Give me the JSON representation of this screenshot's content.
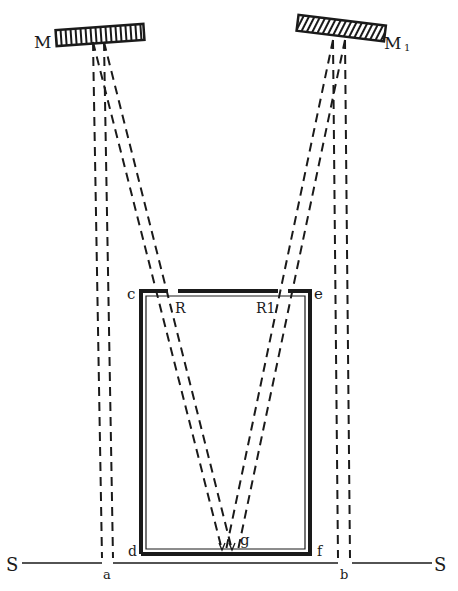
{
  "labels": {
    "M": "M",
    "M1": "M",
    "M1_sub": "1",
    "c": "c",
    "e": "e",
    "R": "R",
    "R1": "R1",
    "d": "d",
    "f": "f",
    "g": "g",
    "S_left": "S",
    "S_right": "S",
    "a": "a",
    "b": "b"
  },
  "colors": {
    "ink": "#1a1a1a",
    "background": "#ffffff"
  }
}
